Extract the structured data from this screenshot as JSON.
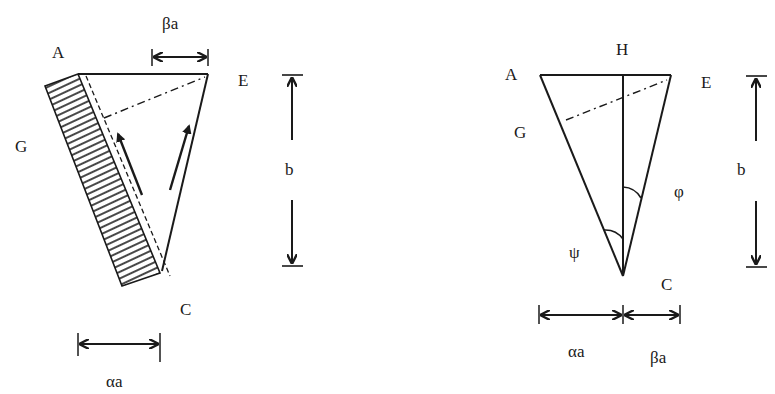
{
  "figure": {
    "left_panel": {
      "points": {
        "A": "A",
        "E": "E",
        "G": "G",
        "C": "C"
      },
      "dimensions": {
        "top_width": "βa",
        "bottom_width": "αa",
        "height": "b"
      }
    },
    "right_panel": {
      "points": {
        "A": "A",
        "E": "E",
        "G": "G",
        "C": "C",
        "H": "H"
      },
      "angles": {
        "psi": "ψ",
        "phi": "φ"
      },
      "dimensions": {
        "left_width": "αa",
        "right_width": "βa",
        "height": "b"
      }
    },
    "colors": {
      "ink": "#1a1a1a",
      "background": "#ffffff"
    }
  }
}
